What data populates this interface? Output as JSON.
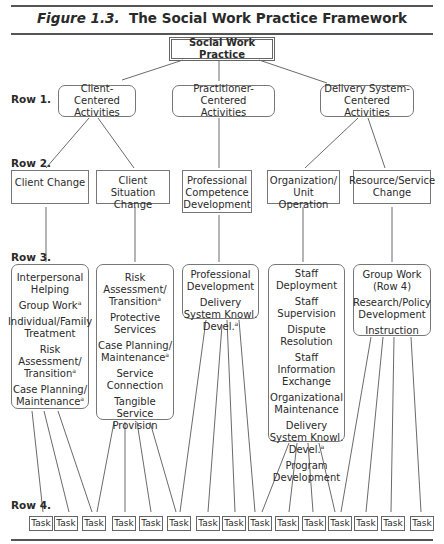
{
  "title": {
    "prefix": "Figure 1.3.",
    "text": "The Social Work Practice Framework"
  },
  "root": {
    "label": "Social Work Practice"
  },
  "row_labels": [
    "Row 1.",
    "Row 2.",
    "Row 3.",
    "Row 4."
  ],
  "row1": [
    {
      "lines": [
        "Client-Centered",
        "Activities"
      ]
    },
    {
      "lines": [
        "Practitioner-Centered",
        "Activities"
      ]
    },
    {
      "lines": [
        "Delivery System-",
        "Centered Activities"
      ]
    }
  ],
  "row2": [
    {
      "lines": [
        "Client Change"
      ]
    },
    {
      "lines": [
        "Client Situation",
        "Change"
      ]
    },
    {
      "lines": [
        "Professional",
        "Competence",
        "Development"
      ]
    },
    {
      "lines": [
        "Organization/",
        "Unit Operation"
      ]
    },
    {
      "lines": [
        "Resource/Service",
        "Change"
      ]
    }
  ],
  "row3": [
    {
      "items": [
        "Interpersonal Helping",
        "Group Work",
        "Individual/Family Treatment",
        "Risk Assessment/ Transition",
        "Case Planning/ Maintenance"
      ]
    },
    {
      "items": [
        "Risk Assessment/ Transition",
        "Protective Services",
        "Case Planning/ Maintenance",
        "Service Connection",
        "Tangible Service Provision"
      ]
    },
    {
      "items": [
        "Professional Development",
        "Delivery System Knowl. Devel."
      ]
    },
    {
      "items": [
        "Staff Deployment",
        "Staff Supervision",
        "Dispute Resolution",
        "Staff Information Exchange",
        "Organizational Maintenance",
        "Delivery System Knowl. Devel.",
        "Program Development"
      ]
    },
    {
      "items": [
        "Group Work (Row 4)",
        "Research/Policy Development",
        "Instruction"
      ]
    }
  ],
  "footnote_marker": "a",
  "task_label": "Task",
  "task_count": 15
}
